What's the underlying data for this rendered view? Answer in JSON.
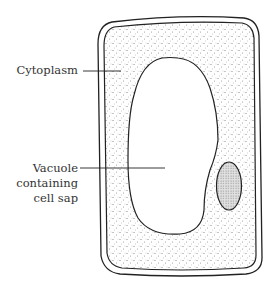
{
  "diagram": {
    "labels": {
      "cytoplasm": "Cytoplasm",
      "vacuole_line1": "Vacuole",
      "vacuole_line2": "containing",
      "vacuole_line3": "cell sap"
    },
    "parts": [
      "cell-wall",
      "cell-membrane",
      "cytoplasm",
      "vacuole",
      "nucleus"
    ],
    "colors": {
      "stroke": "#222222",
      "stipple": "#666666",
      "nucleus_fill": "#d8d8d8",
      "text": "#333333"
    }
  }
}
